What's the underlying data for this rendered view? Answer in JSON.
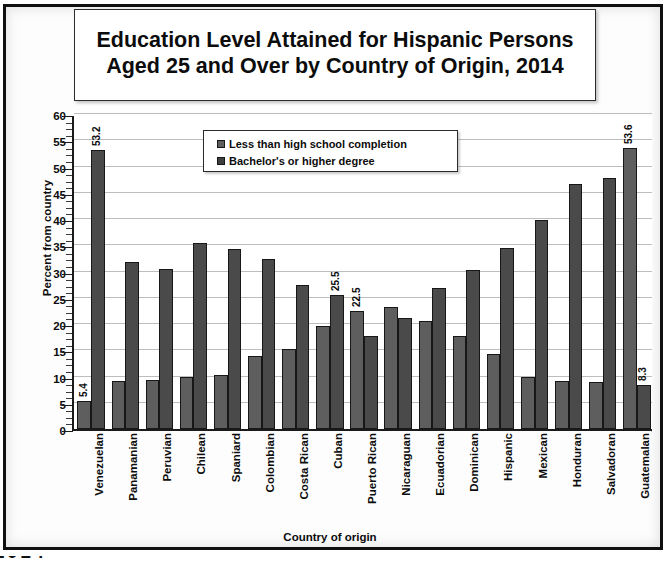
{
  "title": "Education Level Attained for Hispanic Persons Aged 25 and Over by Country of Origin, 2014",
  "bleed_text": "2014",
  "axis": {
    "y_title": "Percent from country",
    "x_title": "Country of origin",
    "y_ticks": [
      "60",
      "55",
      "50",
      "45",
      "40",
      "35",
      "30",
      "25",
      "20",
      "15",
      "10",
      "5",
      "0"
    ]
  },
  "legend": {
    "items": [
      {
        "label": "Less than high school completion",
        "color": "#5e5e5e"
      },
      {
        "label": "Bachelor's or higher degree",
        "color": "#3f3f3f"
      }
    ]
  },
  "chart_data": {
    "type": "bar",
    "title": "Education Level Attained for Hispanic Persons Aged 25 and Over by Country of Origin, 2014",
    "xlabel": "Country of origin",
    "ylabel": "Percent from country",
    "ylim": [
      0,
      60
    ],
    "ytick_step": 5,
    "grid": true,
    "legend_position": "top-center",
    "categories": [
      "Venezuelan",
      "Panamanian",
      "Peruvian",
      "Chilean",
      "Spaniard",
      "Colombian",
      "Costa Rican",
      "Cuban",
      "Puerto Rican",
      "Nicaraguan",
      "Ecuadorian",
      "Dominican",
      "Hispanic",
      "Mexican",
      "Honduran",
      "Salvadoran",
      "Guatemalan"
    ],
    "series": [
      {
        "name": "Less than high school completion",
        "color": "#5e5e5e",
        "values": [
          5.4,
          9.2,
          9.3,
          9.9,
          10.2,
          14.0,
          15.2,
          19.7,
          22.5,
          23.2,
          20.6,
          17.7,
          14.2,
          9.9,
          9.1,
          8.9,
          53.6
        ]
      },
      {
        "name": "Bachelor's or higher degree",
        "color": "#4a4a4a",
        "values": [
          53.2,
          31.8,
          30.4,
          35.4,
          34.2,
          32.4,
          27.4,
          25.5,
          17.7,
          21.2,
          26.8,
          30.3,
          34.5,
          39.8,
          46.6,
          47.8,
          8.3
        ]
      }
    ],
    "annotations": [
      {
        "category": "Venezuelan",
        "series": "Less than high school completion",
        "text": "5.4"
      },
      {
        "category": "Venezuelan",
        "series": "Bachelor's or higher degree",
        "text": "53.2"
      },
      {
        "category": "Cuban",
        "series": "Bachelor's or higher degree",
        "text": "25.5"
      },
      {
        "category": "Puerto Rican",
        "series": "Less than high school completion",
        "text": "22.5"
      },
      {
        "category": "Guatemalan",
        "series": "Less than high school completion",
        "text": "53.6"
      },
      {
        "category": "Guatemalan",
        "series": "Bachelor's or higher degree",
        "text": "8.3"
      }
    ]
  }
}
